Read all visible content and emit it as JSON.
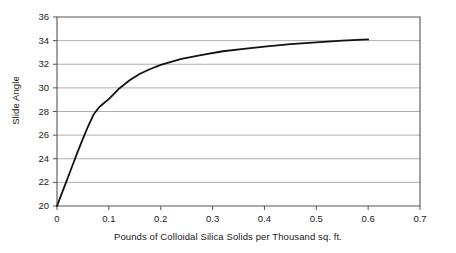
{
  "chart_data": {
    "type": "line",
    "title": "",
    "xlabel": "Pounds of Colloidal Silica Solids per Thousand sq. ft.",
    "ylabel": "Slide Angle",
    "xlim": [
      0,
      0.7
    ],
    "ylim": [
      20,
      36
    ],
    "xticks": [
      "0",
      "0.1",
      "0.2",
      "0.3",
      "0.4",
      "0.5",
      "0.6",
      "0.7"
    ],
    "xtick_values": [
      0,
      0.1,
      0.2,
      0.3,
      0.4,
      0.5,
      0.6,
      0.7
    ],
    "yticks": [
      "20",
      "22",
      "24",
      "26",
      "28",
      "30",
      "32",
      "34",
      "36"
    ],
    "ytick_values": [
      20,
      22,
      24,
      26,
      28,
      30,
      32,
      34,
      36
    ],
    "grid": "horizontal",
    "legend": "none",
    "series": [
      {
        "name": "Slide Angle vs Colloidal Silica",
        "color": "#111111",
        "line_width": 1.8,
        "x": [
          0,
          0.01,
          0.02,
          0.03,
          0.04,
          0.05,
          0.06,
          0.07,
          0.08,
          0.09,
          0.1,
          0.12,
          0.14,
          0.16,
          0.18,
          0.2,
          0.24,
          0.28,
          0.32,
          0.36,
          0.4,
          0.45,
          0.5,
          0.55,
          0.6
        ],
        "y": [
          20.0,
          21.15,
          22.3,
          23.45,
          24.6,
          25.7,
          26.75,
          27.7,
          28.3,
          28.7,
          29.05,
          29.95,
          30.65,
          31.2,
          31.6,
          31.95,
          32.45,
          32.8,
          33.1,
          33.3,
          33.5,
          33.7,
          33.85,
          34.0,
          34.1
        ]
      }
    ]
  },
  "plot_geometry": {
    "left": 57,
    "right": 420,
    "top": 17,
    "bottom": 206
  },
  "axis_colors": {
    "frame": "#555555",
    "gridline": "#9a9a9a",
    "text": "#1a1a1a"
  }
}
